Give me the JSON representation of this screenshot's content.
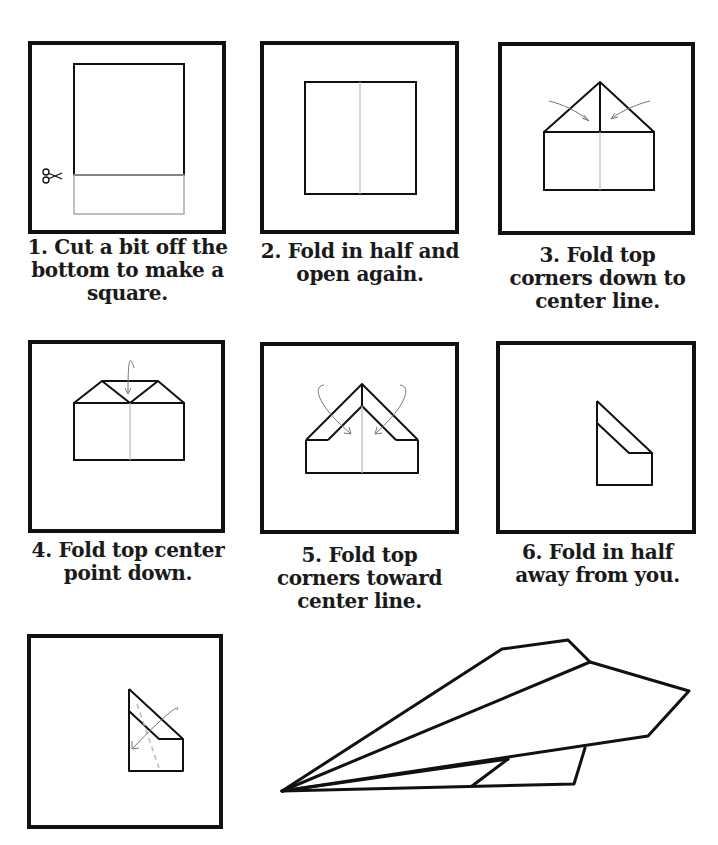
{
  "colors": {
    "line": "#111111",
    "fold_line": "#bbbbbb",
    "arrow": "#777777",
    "background": "#ffffff"
  },
  "steps": [
    {
      "number": "1",
      "caption": "1. Cut a bit off the bottom to make a square.",
      "icon": "scissors-icon"
    },
    {
      "number": "2",
      "caption": "2. Fold in half and open again."
    },
    {
      "number": "3",
      "caption": "3. Fold top corners down to center line."
    },
    {
      "number": "4",
      "caption": "4. Fold top center point down."
    },
    {
      "number": "5",
      "caption": "5. Fold top corners toward center line."
    },
    {
      "number": "6",
      "caption": "6. Fold in half away from you."
    },
    {
      "number": "7",
      "caption": ""
    }
  ],
  "final": {
    "name": "finished paper airplane"
  }
}
